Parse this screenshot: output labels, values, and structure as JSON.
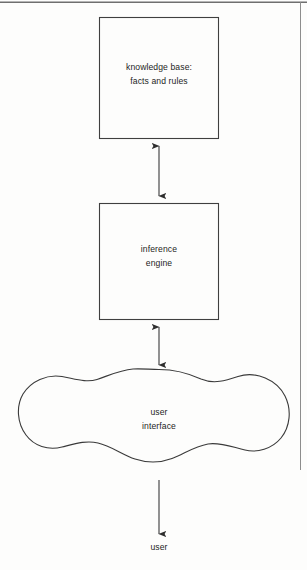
{
  "diagram": {
    "type": "block-flow",
    "background_color": "#fdfdfc",
    "stroke_color": "#3a3a3a",
    "text_color": "#1d1d1d",
    "page_rules": {
      "top_rule": "horizontal line across top of page",
      "right_rule": "vertical line down right margin"
    },
    "nodes": [
      {
        "id": "knowledge-base",
        "shape": "rectangle",
        "line1": "knowledge base:",
        "line2": "facts and rules",
        "x": 99,
        "y": 17,
        "width": 120,
        "height": 122
      },
      {
        "id": "inference-engine",
        "shape": "rectangle",
        "line1": "inference",
        "line2": "engine",
        "x": 99,
        "y": 203,
        "width": 120,
        "height": 117
      },
      {
        "id": "user-interface",
        "shape": "cloud",
        "line1": "user",
        "line2": "interface",
        "x": 22,
        "y": 368,
        "width": 268,
        "height": 110
      }
    ],
    "connectors": [
      {
        "id": "kb-to-ie",
        "from": "knowledge-base",
        "to": "inference-engine",
        "arrowheads": "both",
        "orientation": "vertical"
      },
      {
        "id": "ie-to-ui",
        "from": "inference-engine",
        "to": "user-interface",
        "arrowheads": "both",
        "orientation": "vertical"
      },
      {
        "id": "ui-to-user",
        "from": "user-interface",
        "to": "user",
        "arrowheads": "end",
        "orientation": "vertical"
      }
    ],
    "terminal_label": "user"
  }
}
